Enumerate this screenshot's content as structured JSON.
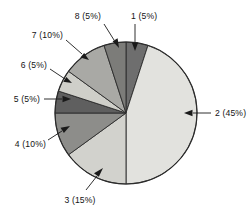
{
  "chart_data": {
    "type": "pie",
    "title": "",
    "xlabel": "",
    "ylabel": "",
    "legend_position": "none",
    "grid": false,
    "start_angle_deg": 0,
    "direction": "clockwise",
    "units": "percent",
    "total": 100,
    "categories": [
      "1",
      "2",
      "3",
      "4",
      "5",
      "6",
      "7",
      "8"
    ],
    "values": [
      5,
      45,
      15,
      10,
      5,
      5,
      10,
      5
    ],
    "labels": [
      "1 (5%)",
      "2 (45%)",
      "3 (15%)",
      "4 (10%)",
      "5 (5%)",
      "6 (5%)",
      "7 (10%)",
      "8 (5%)"
    ],
    "slice_colors": [
      "#6e6e6e",
      "#e2e2de",
      "#d2d2cd",
      "#8d8d8a",
      "#5f5f5f",
      "#cfcfc9",
      "#a9a9a5",
      "#7c7c79"
    ],
    "outline_color": "#2b2b2b",
    "label_color": "#141414",
    "background_color": "#ffffff",
    "slices": [
      {
        "name": "1",
        "value": 5,
        "label": "1 (5%)",
        "color": "#6e6e6e",
        "start_deg": 0,
        "end_deg": 18
      },
      {
        "name": "2",
        "value": 45,
        "label": "2 (45%)",
        "color": "#e2e2de",
        "start_deg": 18,
        "end_deg": 180
      },
      {
        "name": "3",
        "value": 15,
        "label": "3 (15%)",
        "color": "#d2d2cd",
        "start_deg": 180,
        "end_deg": 234
      },
      {
        "name": "4",
        "value": 10,
        "label": "4 (10%)",
        "color": "#8d8d8a",
        "start_deg": 234,
        "end_deg": 270
      },
      {
        "name": "5",
        "value": 5,
        "label": "5 (5%)",
        "color": "#5f5f5f",
        "start_deg": 270,
        "end_deg": 288
      },
      {
        "name": "6",
        "value": 5,
        "label": "6 (5%)",
        "color": "#cfcfc9",
        "start_deg": 288,
        "end_deg": 306
      },
      {
        "name": "7",
        "value": 10,
        "label": "7 (10%)",
        "color": "#a9a9a5",
        "start_deg": 306,
        "end_deg": 342
      },
      {
        "name": "8",
        "value": 5,
        "label": "8 (5%)",
        "color": "#7c7c79",
        "start_deg": 342,
        "end_deg": 360
      }
    ]
  }
}
